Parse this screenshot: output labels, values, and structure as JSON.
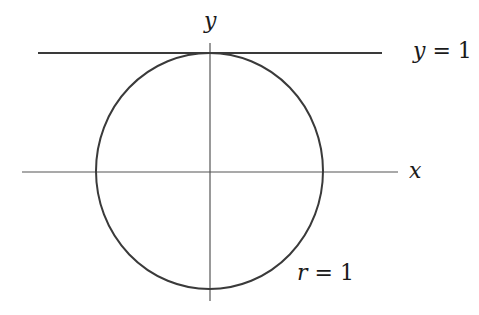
{
  "diagram": {
    "axes": {
      "x_label": "x",
      "y_label": "y"
    },
    "tangent_line": {
      "label_var": "y",
      "label_eq": " = ",
      "label_val": "1"
    },
    "circle": {
      "label_var": "r",
      "label_eq": " = ",
      "label_val": "1"
    },
    "colors": {
      "stroke": "#3a3a3a",
      "axis": "#555555",
      "text": "#1a1a1a"
    }
  }
}
